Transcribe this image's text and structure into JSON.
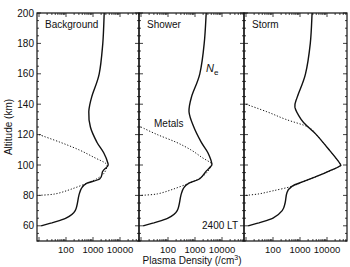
{
  "chart_data": {
    "type": "line",
    "title": "",
    "xlabel": "Plasma Density (/cm³)",
    "ylabel": "Altitude (km)",
    "xscale": "log",
    "xlim": [
      10,
      50000
    ],
    "ylim": [
      50,
      200
    ],
    "yticks": [
      60,
      80,
      100,
      120,
      140,
      160,
      180,
      200
    ],
    "xticks": [
      100,
      1000,
      10000
    ],
    "xtick_labels": [
      "100",
      "1000",
      "10000"
    ],
    "annotations": {
      "ne_label": "N",
      "ne_sub": "e",
      "metals_label": "Metals",
      "time_label": "2400 LT"
    },
    "panels": [
      {
        "name": "Background",
        "series": [
          {
            "name": "Ne",
            "style": "solid",
            "points": [
              [
                200,
                2600
              ],
              [
                180,
                2300
              ],
              [
                160,
                1700
              ],
              [
                145,
                900
              ],
              [
                135,
                700
              ],
              [
                125,
                800
              ],
              [
                115,
                1400
              ],
              [
                108,
                2500
              ],
              [
                101,
                3600
              ],
              [
                99,
                3400
              ],
              [
                96,
                2300
              ],
              [
                91,
                1800
              ],
              [
                88,
                600
              ],
              [
                85,
                380
              ],
              [
                80,
                300
              ],
              [
                70,
                220
              ],
              [
                65,
                100
              ],
              [
                62,
                30
              ],
              [
                60,
                12
              ]
            ]
          },
          {
            "name": "Metals",
            "style": "dotted",
            "points": [
              [
                120,
                10
              ],
              [
                115,
                60
              ],
              [
                110,
                300
              ],
              [
                105,
                1100
              ],
              [
                101,
                3000
              ],
              [
                98,
                3200
              ],
              [
                94,
                2400
              ],
              [
                91,
                1400
              ],
              [
                88,
                600
              ],
              [
                84,
                150
              ],
              [
                81,
                40
              ],
              [
                80,
                10
              ]
            ]
          }
        ]
      },
      {
        "name": "Shower",
        "series": [
          {
            "name": "Ne",
            "style": "solid",
            "points": [
              [
                200,
                2600
              ],
              [
                180,
                2200
              ],
              [
                160,
                1500
              ],
              [
                145,
                750
              ],
              [
                135,
                600
              ],
              [
                125,
                900
              ],
              [
                115,
                1700
              ],
              [
                108,
                3000
              ],
              [
                101,
                4200
              ],
              [
                99,
                3800
              ],
              [
                96,
                2600
              ],
              [
                91,
                1500
              ],
              [
                88,
                600
              ],
              [
                85,
                380
              ],
              [
                80,
                300
              ],
              [
                70,
                220
              ],
              [
                65,
                100
              ],
              [
                62,
                30
              ],
              [
                60,
                12
              ]
            ]
          },
          {
            "name": "Metals",
            "style": "dotted",
            "points": [
              [
                125,
                10
              ],
              [
                120,
                40
              ],
              [
                115,
                200
              ],
              [
                110,
                700
              ],
              [
                105,
                1800
              ],
              [
                101,
                4000
              ],
              [
                98,
                3600
              ],
              [
                94,
                2400
              ],
              [
                91,
                1400
              ],
              [
                88,
                600
              ],
              [
                84,
                150
              ],
              [
                81,
                40
              ],
              [
                80,
                10
              ]
            ]
          }
        ]
      },
      {
        "name": "Storm",
        "series": [
          {
            "name": "Ne",
            "style": "solid",
            "points": [
              [
                200,
                2800
              ],
              [
                180,
                2400
              ],
              [
                160,
                1600
              ],
              [
                145,
                800
              ],
              [
                138,
                650
              ],
              [
                130,
                1100
              ],
              [
                125,
                2000
              ],
              [
                120,
                4000
              ],
              [
                110,
                12000
              ],
              [
                101,
                30000
              ],
              [
                99,
                28000
              ],
              [
                96,
                12000
              ],
              [
                92,
                3500
              ],
              [
                89,
                1300
              ],
              [
                86,
                500
              ],
              [
                82,
                330
              ],
              [
                75,
                280
              ],
              [
                70,
                220
              ],
              [
                65,
                100
              ],
              [
                62,
                30
              ],
              [
                60,
                12
              ]
            ]
          },
          {
            "name": "Metals",
            "style": "dotted",
            "points": [
              [
                140,
                10
              ],
              [
                135,
                60
              ],
              [
                130,
                300
              ],
              [
                125,
                2000
              ],
              [
                120,
                4000
              ],
              [
                110,
                12000
              ],
              [
                101,
                30000
              ],
              [
                99,
                28000
              ],
              [
                96,
                12000
              ],
              [
                92,
                3500
              ],
              [
                89,
                1300
              ],
              [
                86,
                500
              ],
              [
                83,
                100
              ],
              [
                81,
                30
              ],
              [
                80,
                10
              ]
            ]
          }
        ]
      }
    ],
    "grid": false,
    "legend": "none"
  }
}
